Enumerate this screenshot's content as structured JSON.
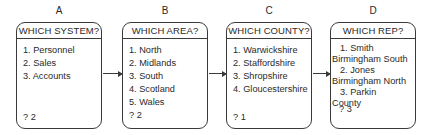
{
  "diagram": {
    "columns": [
      {
        "label": "A",
        "title": "WHICH SYSTEM?",
        "options": [
          "1. Personnel",
          "2. Sales",
          "3. Accounts"
        ],
        "answer": "? 2"
      },
      {
        "label": "B",
        "title": "WHICH AREA?",
        "options": [
          "1. North",
          "2. Midlands",
          "3. South",
          "4. Scotland",
          "5. Wales"
        ],
        "answer": "? 2"
      },
      {
        "label": "C",
        "title": "WHICH COUNTY?",
        "options": [
          "1. Warwickshire",
          "2. Staffordshire",
          "3. Shropshire",
          "4. Gloucestershire"
        ],
        "answer": "? 1"
      },
      {
        "label": "D",
        "title": "WHICH REP?",
        "options": [
          {
            "name": "1. Smith",
            "area": "Birmingham South"
          },
          {
            "name": "2. Jones",
            "area": "Birmingham North"
          },
          {
            "name": "3. Parkin",
            "area": "County"
          }
        ],
        "answer": "? 3"
      }
    ],
    "connectors": [
      {
        "from": "A",
        "to": "B"
      },
      {
        "from": "B",
        "to": "C"
      },
      {
        "from": "C",
        "to": "D"
      }
    ],
    "colors": {
      "line": "#3a3a3a",
      "text": "#2a2a2a",
      "background": "#ffffff"
    }
  }
}
